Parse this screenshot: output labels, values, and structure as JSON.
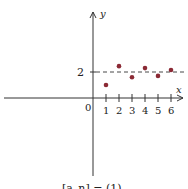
{
  "chart_data": {
    "type": "scatter",
    "title": "",
    "xlabel": "x",
    "ylabel": "y",
    "origin_label": "0",
    "x_ticks": [
      "1",
      "2",
      "3",
      "4",
      "5",
      "6"
    ],
    "y_ticks": [
      "2"
    ],
    "reference_line": {
      "y": 2,
      "style": "dashed"
    },
    "series": [
      {
        "name": "points",
        "x": [
          1,
          2,
          3,
          4,
          5,
          6
        ],
        "y": [
          1.0,
          2.45,
          1.6,
          2.3,
          1.7,
          2.15
        ],
        "color": "#8b2a35"
      }
    ],
    "xlim": [
      -7,
      7
    ],
    "ylim": [
      -6,
      7
    ],
    "grid": false,
    "caption": "[a_n] = (1)..."
  },
  "colors": {
    "point": "#8b2a35",
    "axis": "#333333"
  }
}
